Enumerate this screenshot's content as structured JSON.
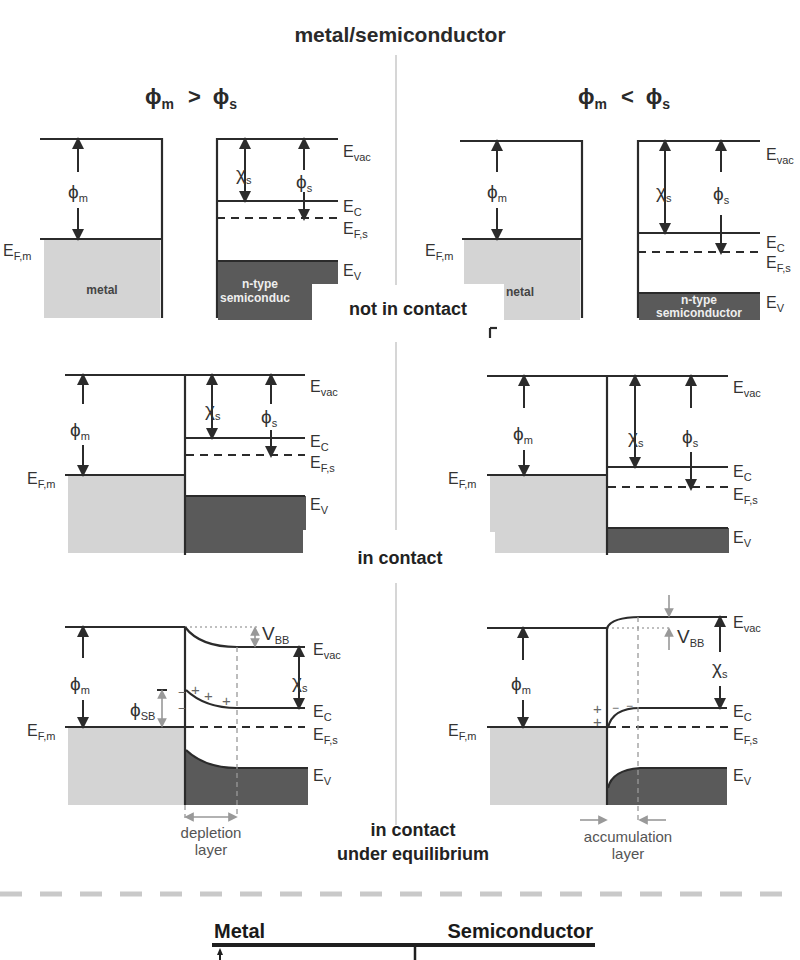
{
  "title": "metal/semiconductor",
  "conditions": {
    "left": {
      "phi_left": "ϕ",
      "sub_left": "m",
      "op": ">",
      "phi_right": "ϕ",
      "sub_right": "s"
    },
    "right": {
      "phi_left": "ϕ",
      "sub_left": "m",
      "op": "<",
      "phi_right": "ϕ",
      "sub_right": "s"
    }
  },
  "sections": {
    "not_in_contact": "not in contact",
    "in_contact": "in contact",
    "equilibrium_line1": "in contact",
    "equilibrium_line2": "under equilibrium"
  },
  "labels": {
    "E": "E",
    "vac": "vac",
    "C": "C",
    "Fs": "F,s",
    "Fm": "F,m",
    "V": "V",
    "phi": "ϕ",
    "chi": "χ",
    "m": "m",
    "s": "s",
    "SB": "SB",
    "VBB_V": "V",
    "VBB_sub": "BB",
    "metal": "metal",
    "metal_partial": "netal",
    "ntype": "n-type",
    "semiconductor": "semiconductor",
    "semiconductor_partial": "semiconduc",
    "plus": "+",
    "minus": "−",
    "depletion1": "depletion",
    "depletion2": "layer",
    "accumulation1": "accumulation",
    "accumulation2": "layer"
  },
  "bottom": {
    "metal": "Metal",
    "semiconductor": "Semiconductor"
  },
  "colors": {
    "metal_fill": "#d4d4d4",
    "semiconductor_fill": "#5a5a5a",
    "line": "#2b2b2b",
    "annotation_gray": "#999999"
  }
}
